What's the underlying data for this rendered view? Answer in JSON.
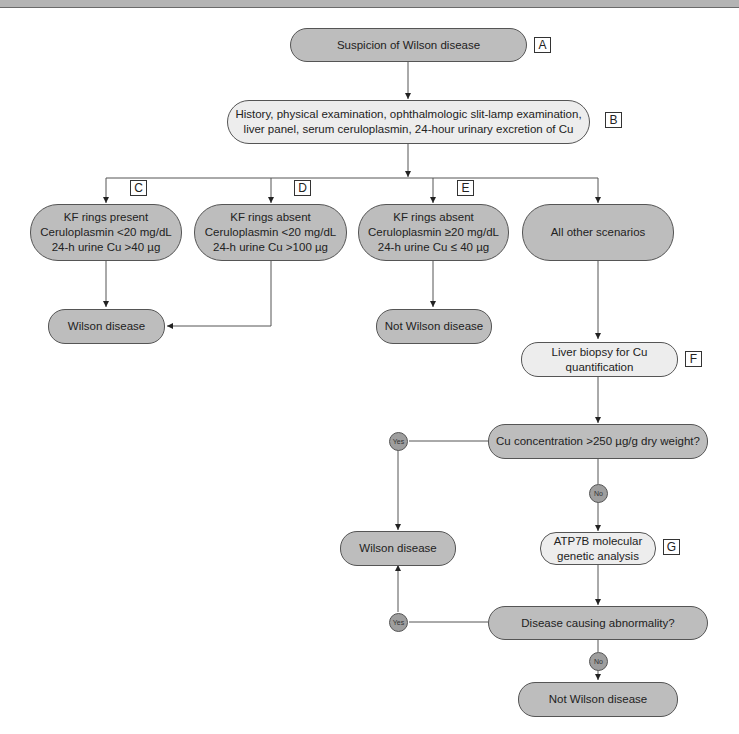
{
  "diagram": {
    "nodes": {
      "A": {
        "text": "Suspicion of Wilson disease",
        "tag": "A"
      },
      "B": {
        "text": "History, physical examination, ophthalmologic slit-lamp examination,\nliver panel, serum ceruloplasmin, 24-hour urinary excretion of Cu",
        "tag": "B"
      },
      "C": {
        "text": "KF rings present\nCeruloplasmin <20 mg/dL\n24-h urine Cu >40 µg",
        "tag": "C"
      },
      "D": {
        "text": "KF rings absent\nCeruloplasmin <20 mg/dL\n24-h urine Cu >100 µg",
        "tag": "D"
      },
      "E": {
        "text": "KF rings absent\nCeruloplasmin ≥20 mg/dL\n24-h urine Cu ≤ 40 µg",
        "tag": "E"
      },
      "other": {
        "text": "All other scenarios"
      },
      "wilson1": {
        "text": "Wilson disease"
      },
      "notwilson1": {
        "text": "Not Wilson disease"
      },
      "F": {
        "text": "Liver biopsy for Cu quantification",
        "tag": "F"
      },
      "cu_q": {
        "text": "Cu concentration >250 µg/g dry weight?"
      },
      "wilson2": {
        "text": "Wilson disease"
      },
      "G": {
        "text": "ATP7B molecular\ngenetic analysis",
        "tag": "G"
      },
      "abn_q": {
        "text": "Disease causing abnormality?"
      },
      "notwilson2": {
        "text": "Not Wilson disease"
      }
    },
    "labels": {
      "yes": "Yes",
      "no": "No"
    }
  }
}
